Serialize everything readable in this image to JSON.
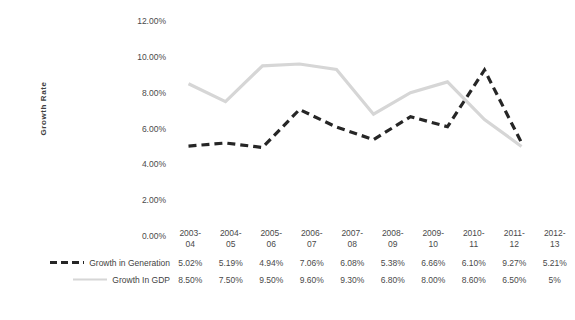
{
  "chart_data": {
    "type": "line",
    "title": "",
    "xlabel": "",
    "ylabel": "Growth Rate",
    "categories": [
      "2003-04",
      "2004-05",
      "2005-06",
      "2006-07",
      "2007-08",
      "2008-09",
      "2009-10",
      "2010-11",
      "2011-12",
      "2012-13"
    ],
    "category_lines": [
      [
        "2003-",
        "04"
      ],
      [
        "2004-",
        "05"
      ],
      [
        "2005-",
        "06"
      ],
      [
        "2006-",
        "07"
      ],
      [
        "2007-",
        "08"
      ],
      [
        "2008-",
        "09"
      ],
      [
        "2009-",
        "10"
      ],
      [
        "2010-",
        "11"
      ],
      [
        "2011-",
        "12"
      ],
      [
        "2012-",
        "13"
      ]
    ],
    "ylim": [
      0,
      12
    ],
    "ytick_labels": [
      "12.00%",
      "10.00%",
      "8.00%",
      "6.00%",
      "4.00%",
      "2.00%",
      "0.00%"
    ],
    "ytick_values": [
      12,
      10,
      8,
      6,
      4,
      2,
      0
    ],
    "grid": false,
    "legend_position": "bottom-left-table",
    "series": [
      {
        "name": "Growth in Generation",
        "color": "#262626",
        "style": "dashed",
        "width": 3.2,
        "values": [
          5.02,
          5.19,
          4.94,
          7.06,
          6.08,
          5.38,
          6.66,
          6.1,
          9.27,
          5.21
        ],
        "labels": [
          "5.02%",
          "5.19%",
          "4.94%",
          "7.06%",
          "6.08%",
          "5.38%",
          "6.66%",
          "6.10%",
          "9.27%",
          "5.21%"
        ]
      },
      {
        "name": "Growth In GDP",
        "color": "#d6d6d6",
        "style": "solid",
        "width": 3.2,
        "values": [
          8.5,
          7.5,
          9.5,
          9.6,
          9.3,
          6.8,
          8.0,
          8.6,
          6.5,
          5.0
        ],
        "labels": [
          "8.50%",
          "7.50%",
          "9.50%",
          "9.60%",
          "9.30%",
          "6.80%",
          "8.00%",
          "8.60%",
          "6.50%",
          "5%"
        ]
      }
    ]
  }
}
